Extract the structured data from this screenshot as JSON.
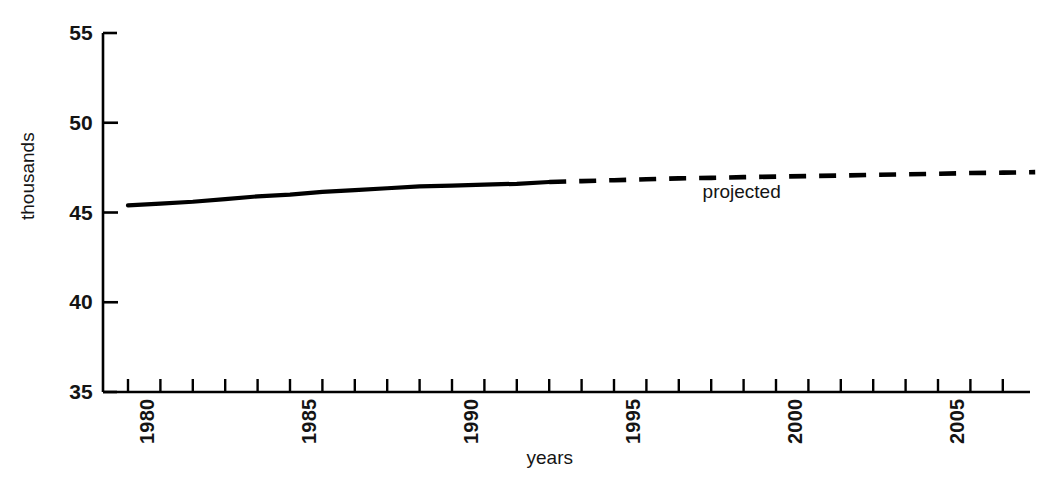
{
  "chart_data": {
    "type": "line",
    "title": "",
    "subtitle": "",
    "xlabel": "years",
    "ylabel": "thousands",
    "xlim": [
      1980,
      2008
    ],
    "ylim": [
      35,
      55
    ],
    "grid": false,
    "legend": "none",
    "y_ticks": [
      "55",
      "50",
      "45",
      "40",
      "35"
    ],
    "y_tick_values": [
      55,
      50,
      45,
      40,
      35
    ],
    "x_tick_labels": [
      "1980",
      "1985",
      "1990",
      "1995",
      "2000",
      "2005"
    ],
    "x_tick_label_values": [
      1980,
      1985,
      1990,
      1995,
      2000,
      2005
    ],
    "x_minor_tick_values": [
      1980,
      1981,
      1982,
      1983,
      1984,
      1985,
      1986,
      1987,
      1988,
      1989,
      1990,
      1991,
      1992,
      1993,
      1994,
      1995,
      1996,
      1997,
      1998,
      1999,
      2000,
      2001,
      2002,
      2003,
      2004,
      2005,
      2006,
      2007,
      2008
    ],
    "annotations": [
      {
        "text": "projected",
        "x": 1999.0,
        "y": 46.2
      }
    ],
    "series": [
      {
        "name": "actual",
        "style": "solid",
        "color": "#000000",
        "x": [
          1980,
          1981,
          1982,
          1983,
          1984,
          1985,
          1986,
          1987,
          1988,
          1989,
          1990,
          1991,
          1992,
          1993
        ],
        "values": [
          45.4,
          45.5,
          45.6,
          45.75,
          45.9,
          46.0,
          46.15,
          46.25,
          46.35,
          46.45,
          46.5,
          46.55,
          46.6,
          46.7
        ]
      },
      {
        "name": "projected",
        "style": "dashed",
        "color": "#000000",
        "x": [
          1993,
          1994,
          1995,
          1996,
          1997,
          1998,
          1999,
          2000,
          2001,
          2002,
          2003,
          2004,
          2005,
          2006,
          2007,
          2008
        ],
        "values": [
          46.7,
          46.75,
          46.8,
          46.85,
          46.9,
          46.93,
          46.97,
          47.0,
          47.03,
          47.06,
          47.1,
          47.13,
          47.16,
          47.2,
          47.22,
          47.25
        ]
      }
    ]
  },
  "axis": {
    "y_label": "thousands",
    "x_label": "years"
  },
  "colors": {
    "line": "#000000",
    "axis": "#000000",
    "background": "#ffffff",
    "text": "#141414"
  }
}
